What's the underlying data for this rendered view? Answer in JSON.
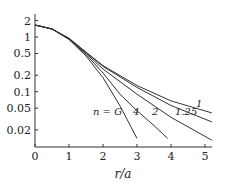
{
  "chart_data": {
    "type": "line",
    "title": "",
    "xlabel": "r/a",
    "ylabel": "",
    "yscale": "log",
    "xlim": [
      0,
      5.2
    ],
    "ylim": [
      0.012,
      2.5
    ],
    "xticks": [
      "0",
      "1",
      "2",
      "3",
      "4",
      "5"
    ],
    "yticks": [
      "2",
      "1",
      "0.5",
      "0.2",
      "0.1",
      "0.05",
      "0.02"
    ],
    "annotation": "n = G",
    "series": [
      {
        "name": "G",
        "label": "n = G",
        "x": [
          0,
          0.5,
          1,
          1.5,
          2,
          2.5,
          3
        ],
        "y": [
          1.66,
          1.4,
          0.9,
          0.45,
          0.18,
          0.055,
          0.014
        ]
      },
      {
        "name": "4",
        "label": "4",
        "x": [
          0,
          0.5,
          1,
          1.5,
          2,
          2.5,
          3,
          3.5,
          3.9
        ],
        "y": [
          1.66,
          1.4,
          0.92,
          0.48,
          0.22,
          0.09,
          0.045,
          0.024,
          0.014
        ]
      },
      {
        "name": "2",
        "label": "2",
        "x": [
          0,
          0.5,
          1,
          1.5,
          2,
          3,
          4,
          5.2
        ],
        "y": [
          1.66,
          1.4,
          0.93,
          0.5,
          0.26,
          0.09,
          0.034,
          0.013
        ]
      },
      {
        "name": "1.25",
        "label": "1.25",
        "x": [
          0,
          0.5,
          1,
          1.5,
          2,
          3,
          4,
          5.2
        ],
        "y": [
          1.66,
          1.4,
          0.94,
          0.52,
          0.29,
          0.12,
          0.056,
          0.028
        ]
      },
      {
        "name": "1",
        "label": "1",
        "x": [
          0,
          0.5,
          1,
          1.5,
          2,
          3,
          4,
          5.2
        ],
        "y": [
          1.66,
          1.4,
          0.95,
          0.53,
          0.3,
          0.13,
          0.068,
          0.041
        ]
      }
    ]
  }
}
